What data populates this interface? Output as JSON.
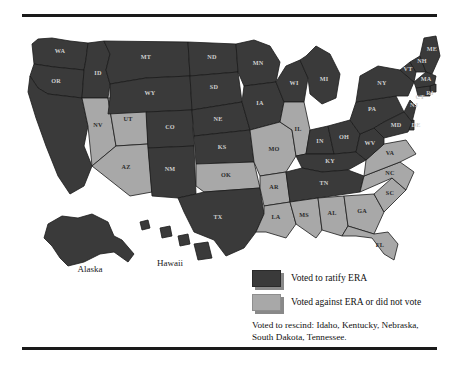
{
  "figure": {
    "type": "choropleth-map",
    "rules": {
      "top": "horizontal-rule",
      "bottom": "horizontal-rule"
    }
  },
  "legend": {
    "items": [
      {
        "swatch": "dark",
        "color": "#3a3a3a",
        "label": "Voted to ratify ERA"
      },
      {
        "swatch": "light",
        "color": "#a8a8a8",
        "label": "Voted against ERA or did not vote"
      }
    ],
    "note": "Voted to rescind: Idaho, Kentucky, Nebraska, South Dakota, Tennessee."
  },
  "insets": [
    {
      "name": "Alaska",
      "status": "ratify"
    },
    {
      "name": "Hawaii",
      "status": "ratify"
    }
  ],
  "map_data": {
    "categories": [
      "ratify",
      "against_or_no_vote"
    ],
    "colors": {
      "ratify": "#3a3a3a",
      "against_or_no_vote": "#a8a8a8",
      "border": "#1a1a1a"
    },
    "states": [
      {
        "abbr": "WA",
        "status": "ratify"
      },
      {
        "abbr": "OR",
        "status": "ratify"
      },
      {
        "abbr": "ID",
        "status": "ratify"
      },
      {
        "abbr": "MT",
        "status": "ratify"
      },
      {
        "abbr": "WY",
        "status": "ratify"
      },
      {
        "abbr": "NV",
        "status": "against_or_no_vote"
      },
      {
        "abbr": "UT",
        "status": "against_or_no_vote"
      },
      {
        "abbr": "AZ",
        "status": "against_or_no_vote"
      },
      {
        "abbr": "CO",
        "status": "ratify"
      },
      {
        "abbr": "NM",
        "status": "ratify"
      },
      {
        "abbr": "ND",
        "status": "ratify"
      },
      {
        "abbr": "SD",
        "status": "ratify"
      },
      {
        "abbr": "NE",
        "status": "ratify"
      },
      {
        "abbr": "KS",
        "status": "ratify"
      },
      {
        "abbr": "OK",
        "status": "against_or_no_vote"
      },
      {
        "abbr": "TX",
        "status": "ratify"
      },
      {
        "abbr": "MN",
        "status": "ratify"
      },
      {
        "abbr": "IA",
        "status": "ratify"
      },
      {
        "abbr": "MO",
        "status": "against_or_no_vote"
      },
      {
        "abbr": "AR",
        "status": "against_or_no_vote"
      },
      {
        "abbr": "LA",
        "status": "against_or_no_vote"
      },
      {
        "abbr": "WI",
        "status": "ratify"
      },
      {
        "abbr": "IL",
        "status": "against_or_no_vote"
      },
      {
        "abbr": "MI",
        "status": "ratify"
      },
      {
        "abbr": "IN",
        "status": "ratify"
      },
      {
        "abbr": "KY",
        "status": "ratify"
      },
      {
        "abbr": "TN",
        "status": "ratify"
      },
      {
        "abbr": "MS",
        "status": "against_or_no_vote"
      },
      {
        "abbr": "AL",
        "status": "against_or_no_vote"
      },
      {
        "abbr": "GA",
        "status": "against_or_no_vote"
      },
      {
        "abbr": "FL",
        "status": "against_or_no_vote"
      },
      {
        "abbr": "SC",
        "status": "against_or_no_vote"
      },
      {
        "abbr": "NC",
        "status": "against_or_no_vote"
      },
      {
        "abbr": "VA",
        "status": "against_or_no_vote"
      },
      {
        "abbr": "WV",
        "status": "ratify"
      },
      {
        "abbr": "OH",
        "status": "ratify"
      },
      {
        "abbr": "PA",
        "status": "ratify"
      },
      {
        "abbr": "NY",
        "status": "ratify"
      },
      {
        "abbr": "VT",
        "status": "ratify"
      },
      {
        "abbr": "NH",
        "status": "ratify"
      },
      {
        "abbr": "ME",
        "status": "ratify"
      },
      {
        "abbr": "MA",
        "status": "ratify"
      },
      {
        "abbr": "RI",
        "status": "ratify"
      },
      {
        "abbr": "CT",
        "status": "ratify"
      },
      {
        "abbr": "NJ",
        "status": "ratify"
      },
      {
        "abbr": "DE",
        "status": "ratify"
      },
      {
        "abbr": "MD",
        "status": "ratify"
      },
      {
        "abbr": "CA",
        "status": "ratify"
      },
      {
        "abbr": "AK",
        "status": "ratify"
      },
      {
        "abbr": "HI",
        "status": "ratify"
      }
    ],
    "rescinded": [
      "Idaho",
      "Kentucky",
      "Nebraska",
      "South Dakota",
      "Tennessee"
    ]
  }
}
